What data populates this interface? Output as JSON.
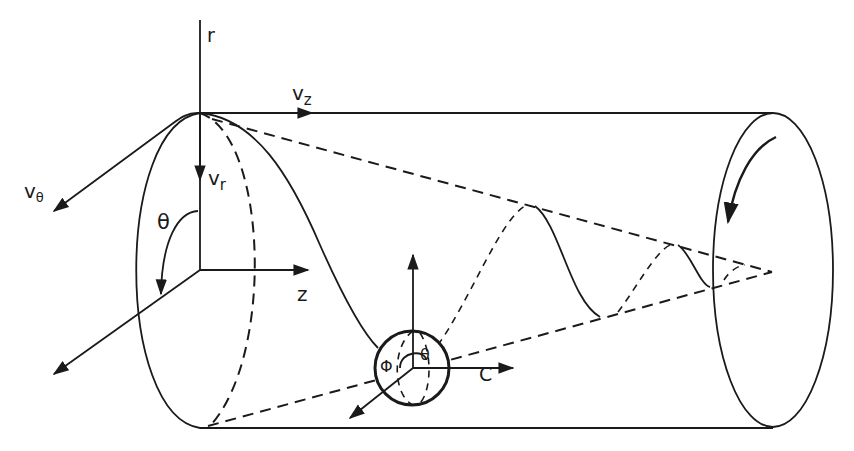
{
  "diagram": {
    "labels": {
      "r_axis": "r",
      "z_axis": "z",
      "v_z": "v",
      "v_z_sub": "z",
      "v_r": "v",
      "v_r_sub": "r",
      "v_theta": "v",
      "v_theta_sub": "θ",
      "theta": "θ",
      "particle_theta": "θ",
      "particle_phi": "Φ",
      "rotation_symbol": "C"
    },
    "colors": {
      "line": "#1a1a1a",
      "background": "#ffffff"
    }
  }
}
